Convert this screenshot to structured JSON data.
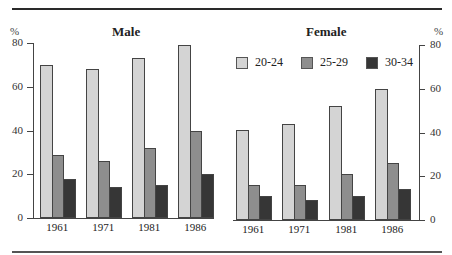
{
  "chart_data": [
    {
      "type": "bar",
      "title": "Male",
      "ylabel": "%",
      "xlabel": "",
      "ylim": [
        0,
        80
      ],
      "yticks": [
        0,
        20,
        40,
        60,
        80
      ],
      "y_axis_position": "left",
      "grid": false,
      "categories": [
        "1961",
        "1971",
        "1981",
        "1986"
      ],
      "series": [
        {
          "name": "20-24",
          "color": "#d4d4d4",
          "values": [
            70,
            68,
            73,
            79
          ]
        },
        {
          "name": "25-29",
          "color": "#8e8e8e",
          "values": [
            29,
            26,
            32,
            40
          ]
        },
        {
          "name": "30-34",
          "color": "#363636",
          "values": [
            18,
            14,
            15,
            20
          ]
        }
      ]
    },
    {
      "type": "bar",
      "title": "Female",
      "ylabel": "%",
      "xlabel": "",
      "ylim": [
        0,
        80
      ],
      "yticks": [
        0,
        20,
        40,
        60,
        80
      ],
      "y_axis_position": "right",
      "grid": false,
      "legend_position": "top",
      "categories": [
        "1961",
        "1971",
        "1981",
        "1986"
      ],
      "series": [
        {
          "name": "20-24",
          "color": "#d4d4d4",
          "values": [
            41,
            44,
            52,
            60
          ]
        },
        {
          "name": "25-29",
          "color": "#8e8e8e",
          "values": [
            16,
            16,
            21,
            26
          ]
        },
        {
          "name": "30-34",
          "color": "#363636",
          "values": [
            11,
            9,
            11,
            14
          ]
        }
      ]
    }
  ],
  "legend": [
    {
      "label": "20-24",
      "color": "#d4d4d4"
    },
    {
      "label": "25-29",
      "color": "#8e8e8e"
    },
    {
      "label": "30-34",
      "color": "#363636"
    }
  ],
  "male": {
    "title": "Male",
    "unit": "%"
  },
  "female": {
    "title": "Female",
    "unit": "%"
  }
}
